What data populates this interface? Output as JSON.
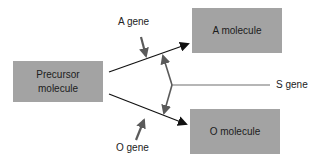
{
  "diagram": {
    "nodes": {
      "precursor": {
        "line1": "Precursor",
        "line2": "molecule"
      },
      "a_molecule": {
        "label": "A molecule"
      },
      "o_molecule": {
        "label": "O molecule"
      }
    },
    "genes": {
      "a_gene": {
        "label": "A  gene"
      },
      "o_gene": {
        "label": "O  gene"
      },
      "s_gene": {
        "label": "S  gene"
      }
    },
    "colors": {
      "box_fill": "#a3a3a3",
      "main_arrow": "#111111",
      "gene_arrow": "#5a5a5a",
      "s_line": "#6e6e6e"
    },
    "edges": [
      {
        "from": "Precursor molecule",
        "to": "A molecule",
        "catalyzed_by": "A gene"
      },
      {
        "from": "Precursor molecule",
        "to": "O molecule",
        "catalyzed_by": "O gene"
      },
      {
        "from": "S gene",
        "to": [
          "Precursor→A pathway",
          "Precursor→O pathway"
        ]
      }
    ]
  }
}
